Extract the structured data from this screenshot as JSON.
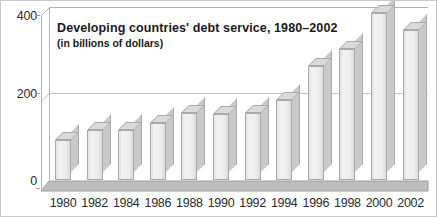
{
  "chart_data": {
    "type": "bar",
    "title": "Developing countries' debt service, 1980–2002",
    "subtitle": "(in billions of dollars)",
    "xlabel": "",
    "ylabel": "",
    "ylim": [
      0,
      400
    ],
    "yticks": [
      "0",
      "200",
      "400"
    ],
    "ytick_values": [
      0,
      200,
      400
    ],
    "grid": true,
    "legend": "none",
    "categories": [
      "1980",
      "1982",
      "1984",
      "1986",
      "1988",
      "1990",
      "1992",
      "1994",
      "1996",
      "1998",
      "2000",
      "2002"
    ],
    "values": [
      92,
      115,
      115,
      130,
      155,
      152,
      155,
      185,
      262,
      300,
      385,
      345
    ],
    "units": "billions of dollars",
    "colors": {
      "bar_face": "#ededed",
      "bar_side": "#c9c9c9",
      "bar_top": "#dadada",
      "bar_outline": "#a9a9a9",
      "floor": "#bdbdbd",
      "gridline": "#c2c2c2",
      "axis": "#b0b0b0",
      "text": "#1a1a1a",
      "background": "#ffffff"
    }
  }
}
